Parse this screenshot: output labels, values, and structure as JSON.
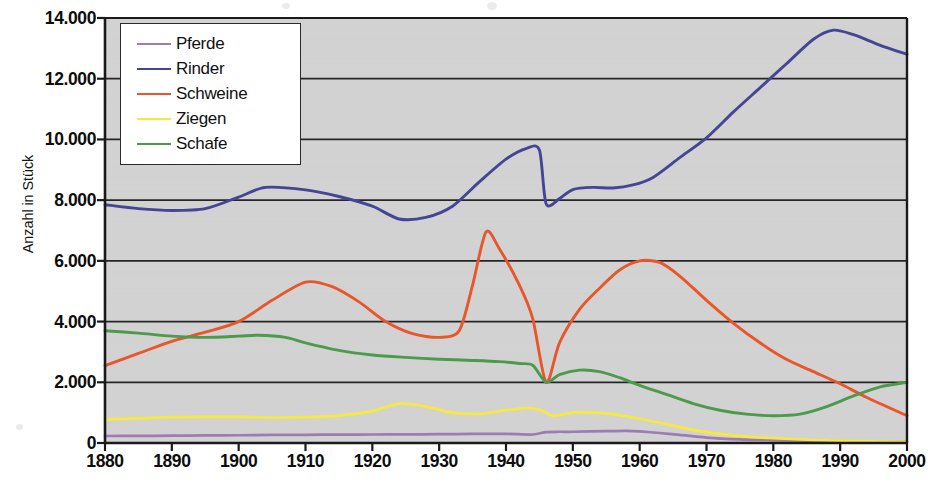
{
  "chart_data": {
    "type": "line",
    "title": "",
    "xlabel": "",
    "ylabel": "Anzahl in Stück",
    "xlim": [
      1880,
      2000
    ],
    "ylim": [
      0,
      14000
    ],
    "grid": true,
    "legend_position": "top-left",
    "x_tick_labels": [
      "1880",
      "1890",
      "1900",
      "1910",
      "1920",
      "1930",
      "1940",
      "1950",
      "1960",
      "1970",
      "1980",
      "1990",
      "2000"
    ],
    "x_ticks": [
      1880,
      1890,
      1900,
      1910,
      1920,
      1930,
      1940,
      1950,
      1960,
      1970,
      1980,
      1990,
      2000
    ],
    "y_tick_labels": [
      "0",
      "2.000",
      "4.000",
      "6.000",
      "8.000",
      "10.000",
      "12.000",
      "14.000"
    ],
    "y_ticks": [
      0,
      2000,
      4000,
      6000,
      8000,
      10000,
      12000,
      14000
    ],
    "plot_background": "#d2d2d2",
    "series": [
      {
        "name": "Pferde",
        "color": "#9d7cb4",
        "x": [
          1880,
          1885,
          1890,
          1895,
          1900,
          1905,
          1910,
          1915,
          1920,
          1925,
          1930,
          1935,
          1940,
          1944,
          1946,
          1948,
          1950,
          1955,
          1958,
          1960,
          1963,
          1966,
          1970,
          1975,
          1980,
          1985,
          1990,
          1995,
          2000
        ],
        "values": [
          230,
          235,
          240,
          250,
          255,
          265,
          270,
          275,
          280,
          285,
          290,
          300,
          300,
          280,
          360,
          370,
          370,
          390,
          400,
          380,
          330,
          270,
          180,
          120,
          95,
          75,
          60,
          45,
          35
        ]
      },
      {
        "name": "Rinder",
        "color": "#454596",
        "x": [
          1880,
          1885,
          1890,
          1895,
          1900,
          1904,
          1910,
          1915,
          1920,
          1924,
          1928,
          1932,
          1936,
          1940,
          1943,
          1945,
          1946,
          1948,
          1950,
          1953,
          1956,
          1959,
          1962,
          1966,
          1970,
          1974,
          1978,
          1982,
          1986,
          1989,
          1992,
          1996,
          2000
        ],
        "values": [
          7850,
          7720,
          7660,
          7720,
          8100,
          8420,
          8340,
          8120,
          7800,
          7380,
          7430,
          7800,
          8600,
          9350,
          9700,
          9650,
          7880,
          8050,
          8350,
          8420,
          8400,
          8500,
          8750,
          9400,
          10050,
          10900,
          11700,
          12500,
          13300,
          13600,
          13450,
          13100,
          12800
        ]
      },
      {
        "name": "Schweine",
        "color": "#e8562a",
        "x": [
          1880,
          1885,
          1890,
          1895,
          1900,
          1905,
          1910,
          1914,
          1918,
          1922,
          1926,
          1930,
          1933,
          1935,
          1937,
          1939,
          1942,
          1944,
          1946,
          1948,
          1951,
          1954,
          1957,
          1960,
          1963,
          1966,
          1970,
          1974,
          1978,
          1982,
          1986,
          1990,
          1994,
          2000
        ],
        "values": [
          2550,
          2950,
          3350,
          3650,
          4000,
          4700,
          5300,
          5150,
          4650,
          4000,
          3600,
          3480,
          3700,
          5200,
          6950,
          6400,
          5200,
          4100,
          2000,
          3300,
          4400,
          5100,
          5700,
          6000,
          5950,
          5500,
          4700,
          3950,
          3300,
          2750,
          2350,
          1950,
          1500,
          900
        ]
      },
      {
        "name": "Ziegen",
        "color": "#f7ea3e",
        "x": [
          1880,
          1885,
          1890,
          1895,
          1900,
          1905,
          1910,
          1915,
          1920,
          1924,
          1928,
          1932,
          1936,
          1940,
          1943,
          1945,
          1947,
          1950,
          1953,
          1956,
          1960,
          1964,
          1968,
          1972,
          1976,
          1980,
          1985,
          1990,
          1995,
          2000
        ],
        "values": [
          780,
          810,
          850,
          860,
          860,
          840,
          850,
          900,
          1050,
          1300,
          1200,
          1000,
          960,
          1080,
          1150,
          1100,
          900,
          1000,
          1000,
          950,
          800,
          620,
          430,
          300,
          210,
          160,
          110,
          75,
          55,
          40
        ]
      },
      {
        "name": "Schafe",
        "color": "#4c9a4c",
        "x": [
          1880,
          1885,
          1890,
          1895,
          1900,
          1903,
          1907,
          1910,
          1915,
          1920,
          1925,
          1930,
          1935,
          1939,
          1942,
          1944,
          1946,
          1948,
          1951,
          1954,
          1957,
          1960,
          1964,
          1968,
          1972,
          1976,
          1980,
          1984,
          1988,
          1992,
          1996,
          2000
        ],
        "values": [
          3700,
          3620,
          3520,
          3480,
          3520,
          3550,
          3480,
          3300,
          3050,
          2900,
          2820,
          2760,
          2720,
          2680,
          2620,
          2560,
          2000,
          2250,
          2400,
          2350,
          2150,
          1900,
          1600,
          1300,
          1080,
          950,
          900,
          950,
          1200,
          1550,
          1850,
          2000
        ]
      }
    ]
  },
  "legend": {
    "items": [
      {
        "label": "Pferde",
        "color": "#9d7cb4"
      },
      {
        "label": "Rinder",
        "color": "#454596"
      },
      {
        "label": "Schweine",
        "color": "#e8562a"
      },
      {
        "label": "Ziegen",
        "color": "#f7ea3e"
      },
      {
        "label": "Schafe",
        "color": "#4c9a4c"
      }
    ]
  },
  "axis": {
    "y_title": "Anzahl in Stück"
  }
}
